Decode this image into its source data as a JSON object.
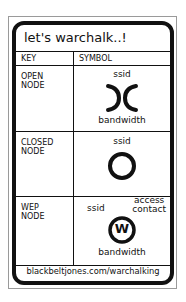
{
  "title": "let's warchalk..!",
  "headers": {
    "key": "KEY",
    "symbol": "SYMBOL"
  },
  "rows": [
    {
      "key_line1": "OPEN",
      "key_line2": "NODE",
      "top_label": "ssid",
      "bottom_label": "bandwidth",
      "symbol": "open-node-icon"
    },
    {
      "key_line1": "CLOSED",
      "key_line2": "NODE",
      "top_label": "ssid",
      "symbol": "closed-node-icon"
    },
    {
      "key_line1": "WEP",
      "key_line2": "NODE",
      "top_label": "ssid",
      "corner_label_line1": "access",
      "corner_label_line2": "contact",
      "circle_letter": "W",
      "bottom_label": "bandwidth",
      "symbol": "wep-node-icon"
    }
  ],
  "footer": "blackbeltjones.com/warchalking"
}
